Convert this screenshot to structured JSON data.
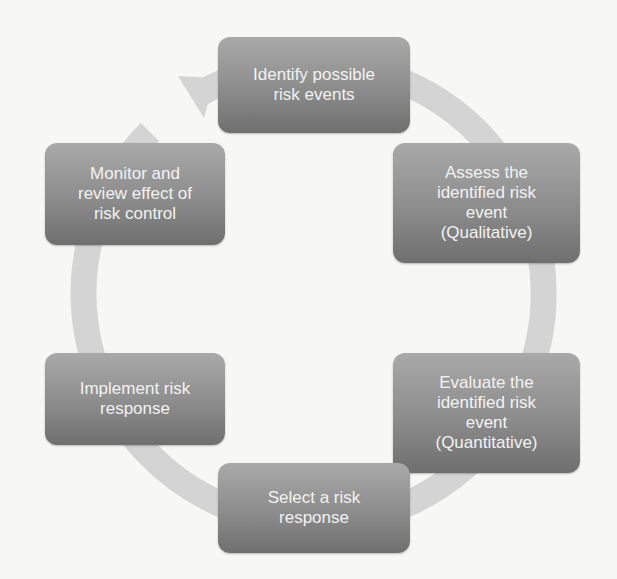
{
  "diagram": {
    "type": "cycle",
    "colors": {
      "background": "#f7f7f5",
      "box_fill_top": "#a9a9a9",
      "box_fill_bottom": "#6f6f6f",
      "box_text": "#f2f2f2",
      "ring": "#d4d4d4"
    },
    "steps": [
      {
        "id": 1,
        "label": "Identify possible\nrisk events"
      },
      {
        "id": 2,
        "label": "Assess the\nidentified risk\nevent\n(Qualitative)"
      },
      {
        "id": 3,
        "label": "Evaluate the\nidentified risk\nevent\n(Quantitative)"
      },
      {
        "id": 4,
        "label": "Select a risk\nresponse"
      },
      {
        "id": 5,
        "label": "Implement risk\nresponse"
      },
      {
        "id": 6,
        "label": "Monitor and\nreview effect of\nrisk control"
      }
    ],
    "flow": "clockwise",
    "arrow": {
      "from_step": 6,
      "to_step": 1
    }
  }
}
